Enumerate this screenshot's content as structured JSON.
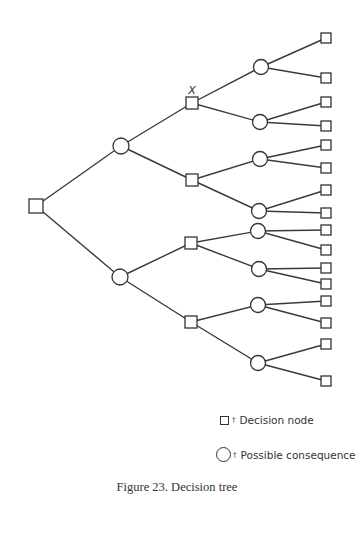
{
  "diagram": {
    "type": "decision-tree",
    "marker_label": "X",
    "nodes": [
      {
        "id": "root",
        "kind": "decision",
        "x": 36,
        "y": 206
      },
      {
        "id": "c1",
        "kind": "consequence",
        "x": 121,
        "y": 146,
        "parent": "root"
      },
      {
        "id": "c2",
        "kind": "consequence",
        "x": 120,
        "y": 277,
        "parent": "root"
      },
      {
        "id": "d1",
        "kind": "decision",
        "x": 192,
        "y": 103,
        "parent": "c1",
        "marked": true
      },
      {
        "id": "d2",
        "kind": "decision",
        "x": 192,
        "y": 180,
        "parent": "c1"
      },
      {
        "id": "d3",
        "kind": "decision",
        "x": 191,
        "y": 243,
        "parent": "c2"
      },
      {
        "id": "d4",
        "kind": "decision",
        "x": 191,
        "y": 322,
        "parent": "c2"
      },
      {
        "id": "c11",
        "kind": "consequence",
        "x": 261,
        "y": 67,
        "parent": "d1"
      },
      {
        "id": "c12",
        "kind": "consequence",
        "x": 260,
        "y": 122,
        "parent": "d1"
      },
      {
        "id": "c21",
        "kind": "consequence",
        "x": 260,
        "y": 159,
        "parent": "d2"
      },
      {
        "id": "c22",
        "kind": "consequence",
        "x": 259,
        "y": 211,
        "parent": "d2"
      },
      {
        "id": "c31",
        "kind": "consequence",
        "x": 258,
        "y": 231,
        "parent": "d3"
      },
      {
        "id": "c32",
        "kind": "consequence",
        "x": 259,
        "y": 269,
        "parent": "d3"
      },
      {
        "id": "c41",
        "kind": "consequence",
        "x": 258,
        "y": 305,
        "parent": "d4"
      },
      {
        "id": "c42",
        "kind": "consequence",
        "x": 258,
        "y": 363,
        "parent": "d4"
      },
      {
        "id": "l1",
        "kind": "decision-leaf",
        "x": 326,
        "y": 38,
        "parent": "c11"
      },
      {
        "id": "l2",
        "kind": "decision-leaf",
        "x": 326,
        "y": 78,
        "parent": "c11"
      },
      {
        "id": "l3",
        "kind": "decision-leaf",
        "x": 326,
        "y": 102,
        "parent": "c12"
      },
      {
        "id": "l4",
        "kind": "decision-leaf",
        "x": 326,
        "y": 126,
        "parent": "c12"
      },
      {
        "id": "l5",
        "kind": "decision-leaf",
        "x": 326,
        "y": 145,
        "parent": "c21"
      },
      {
        "id": "l6",
        "kind": "decision-leaf",
        "x": 326,
        "y": 168,
        "parent": "c21"
      },
      {
        "id": "l7",
        "kind": "decision-leaf",
        "x": 326,
        "y": 190,
        "parent": "c22"
      },
      {
        "id": "l8",
        "kind": "decision-leaf",
        "x": 326,
        "y": 213,
        "parent": "c22"
      },
      {
        "id": "l9",
        "kind": "decision-leaf",
        "x": 326,
        "y": 230,
        "parent": "c31"
      },
      {
        "id": "l10",
        "kind": "decision-leaf",
        "x": 326,
        "y": 250,
        "parent": "c31"
      },
      {
        "id": "l11",
        "kind": "decision-leaf",
        "x": 326,
        "y": 268,
        "parent": "c32"
      },
      {
        "id": "l12",
        "kind": "decision-leaf",
        "x": 326,
        "y": 284,
        "parent": "c32"
      },
      {
        "id": "l13",
        "kind": "decision-leaf",
        "x": 326,
        "y": 301,
        "parent": "c41"
      },
      {
        "id": "l14",
        "kind": "decision-leaf",
        "x": 326,
        "y": 323,
        "parent": "c41"
      },
      {
        "id": "l15",
        "kind": "decision-leaf",
        "x": 326,
        "y": 344,
        "parent": "c42"
      },
      {
        "id": "l16",
        "kind": "decision-leaf",
        "x": 326,
        "y": 381,
        "parent": "c42"
      }
    ]
  },
  "legend": {
    "separator": "†",
    "decision_label": "Decision node",
    "consequence_label": "Possible consequence"
  },
  "caption": "Figure 23. Decision tree",
  "colors": {
    "line": "#3a3a3a",
    "background": "#ffffff"
  }
}
